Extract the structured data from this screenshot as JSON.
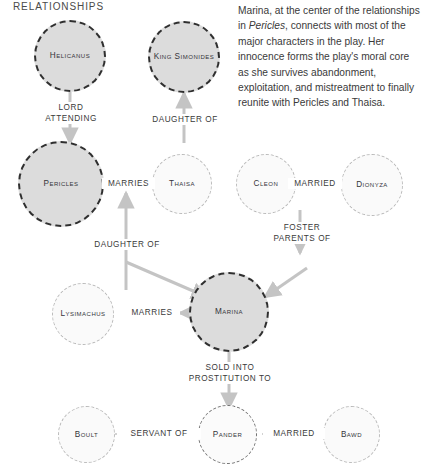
{
  "panel": {
    "title": "RELATIONSHIPS"
  },
  "blurb": {
    "part1": "Marina, at the center of the relationships in ",
    "italic": "Pericles",
    "part2": ", connects with most of the major characters in the play. Her innocence forms the play's moral core as she survives abandonment, exploitation, and mistreatment to finally reunite with Pericles and Thaisa."
  },
  "colors": {
    "major_fill": "#dcdcdc",
    "major_stroke": "#2f2f2f",
    "minor_fill": "#fafafa",
    "minor_stroke": "#b9b9b9",
    "mid_stroke": "#6f6f6f",
    "arrow": "#c4c4c4",
    "text": "#3a3a3a",
    "background": "#ffffff"
  },
  "nodes": [
    {
      "id": "helicanus",
      "label": "Helicanus",
      "emphasis": "major"
    },
    {
      "id": "simonides",
      "label": "King\nSimonides",
      "emphasis": "major"
    },
    {
      "id": "pericles",
      "label": "Pericles",
      "emphasis": "major"
    },
    {
      "id": "thaisa",
      "label": "Thaisa",
      "emphasis": "minor"
    },
    {
      "id": "cleon",
      "label": "Cleon",
      "emphasis": "minor"
    },
    {
      "id": "dionyza",
      "label": "Dionyza",
      "emphasis": "minor"
    },
    {
      "id": "lysimachus",
      "label": "Lysimachus",
      "emphasis": "minor"
    },
    {
      "id": "marina",
      "label": "Marina",
      "emphasis": "major"
    },
    {
      "id": "boult",
      "label": "Boult",
      "emphasis": "minor"
    },
    {
      "id": "pander",
      "label": "Pander",
      "emphasis": "mid"
    },
    {
      "id": "bawd",
      "label": "Bawd",
      "emphasis": "minor"
    }
  ],
  "edges": [
    {
      "id": "helicanus-pericles",
      "label": "LORD\nATTENDING",
      "from": "helicanus",
      "to": "pericles",
      "arrow": "down"
    },
    {
      "id": "thaisa-simonides",
      "label": "DAUGHTER OF",
      "from": "thaisa",
      "to": "simonides",
      "arrow": "up"
    },
    {
      "id": "pericles-thaisa",
      "label": "MARRIES",
      "from": "pericles",
      "to": "thaisa",
      "arrow": "none"
    },
    {
      "id": "cleon-dionyza",
      "label": "MARRIED",
      "from": "cleon",
      "to": "dionyza",
      "arrow": "none"
    },
    {
      "id": "marina-parents",
      "label": "DAUGHTER OF",
      "from": "marina",
      "to": "pericles",
      "arrow": "up"
    },
    {
      "id": "cleon-marina",
      "label": "FOSTER\nPARENTS OF",
      "from": "cleon",
      "to": "marina",
      "arrow": "down"
    },
    {
      "id": "lysimachus-marina",
      "label": "MARRIES",
      "from": "marina",
      "to": "lysimachus",
      "arrow": "left"
    },
    {
      "id": "marina-pander",
      "label": "SOLD INTO\nPROSTITUTION TO",
      "from": "marina",
      "to": "pander",
      "arrow": "down"
    },
    {
      "id": "boult-pander",
      "label": "SERVANT OF",
      "from": "boult",
      "to": "pander",
      "arrow": "none"
    },
    {
      "id": "pander-bawd",
      "label": "MARRIED",
      "from": "pander",
      "to": "bawd",
      "arrow": "none"
    }
  ]
}
